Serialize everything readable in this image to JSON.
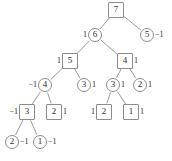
{
  "figure": {
    "type": "binary-tree-diagram",
    "width": 172,
    "height": 161,
    "stroke_color": "#8c8c8c",
    "text_color": "#2b2b2b",
    "background_color": "#ffffff"
  },
  "nodes": [
    {
      "id": "n7",
      "value": "7",
      "shape": "square",
      "cx": 116,
      "cy": 10,
      "label": "",
      "label_side": "none"
    },
    {
      "id": "n6",
      "value": "6",
      "shape": "circle",
      "cx": 95,
      "cy": 35,
      "label": "1",
      "label_side": "left"
    },
    {
      "id": "n5r",
      "value": "5",
      "shape": "circle",
      "cx": 147,
      "cy": 35,
      "label": "−1",
      "label_side": "right"
    },
    {
      "id": "n5",
      "value": "5",
      "shape": "square",
      "cx": 70,
      "cy": 61,
      "label": "1",
      "label_side": "left"
    },
    {
      "id": "n4s",
      "value": "4",
      "shape": "square",
      "cx": 125,
      "cy": 61,
      "label": "1",
      "label_side": "right"
    },
    {
      "id": "n4c",
      "value": "4",
      "shape": "circle",
      "cx": 45,
      "cy": 85,
      "label": "−1",
      "label_side": "left"
    },
    {
      "id": "n3a",
      "value": "3",
      "shape": "circle",
      "cx": 84,
      "cy": 85,
      "label": "1",
      "label_side": "right"
    },
    {
      "id": "n3b",
      "value": "3",
      "shape": "circle",
      "cx": 113,
      "cy": 85,
      "label": "1",
      "label_side": "right"
    },
    {
      "id": "n2c",
      "value": "2",
      "shape": "circle",
      "cx": 140,
      "cy": 85,
      "label": "1",
      "label_side": "right"
    },
    {
      "id": "n3s",
      "value": "3",
      "shape": "square",
      "cx": 27,
      "cy": 112,
      "label": "−1",
      "label_side": "left"
    },
    {
      "id": "n2s",
      "value": "2",
      "shape": "square",
      "cx": 54,
      "cy": 112,
      "label": "1",
      "label_side": "right"
    },
    {
      "id": "n2s2",
      "value": "2",
      "shape": "square",
      "cx": 104,
      "cy": 112,
      "label": "1",
      "label_side": "left"
    },
    {
      "id": "n1s",
      "value": "1",
      "shape": "square",
      "cx": 131,
      "cy": 112,
      "label": "1",
      "label_side": "right"
    },
    {
      "id": "n2b",
      "value": "2",
      "shape": "circle",
      "cx": 12,
      "cy": 142,
      "label": "−1",
      "label_side": "right"
    },
    {
      "id": "n1b",
      "value": "1",
      "shape": "circle",
      "cx": 40,
      "cy": 142,
      "label": "−1",
      "label_side": "right"
    }
  ],
  "edges": [
    {
      "from": "n7",
      "to": "n6"
    },
    {
      "from": "n7",
      "to": "n5r"
    },
    {
      "from": "n6",
      "to": "n5"
    },
    {
      "from": "n6",
      "to": "n4s"
    },
    {
      "from": "n5",
      "to": "n4c"
    },
    {
      "from": "n5",
      "to": "n3a"
    },
    {
      "from": "n4s",
      "to": "n3b"
    },
    {
      "from": "n4s",
      "to": "n2c"
    },
    {
      "from": "n4c",
      "to": "n3s"
    },
    {
      "from": "n4c",
      "to": "n2s"
    },
    {
      "from": "n3b",
      "to": "n2s2"
    },
    {
      "from": "n3b",
      "to": "n1s"
    },
    {
      "from": "n3s",
      "to": "n2b"
    },
    {
      "from": "n3s",
      "to": "n1b"
    }
  ]
}
